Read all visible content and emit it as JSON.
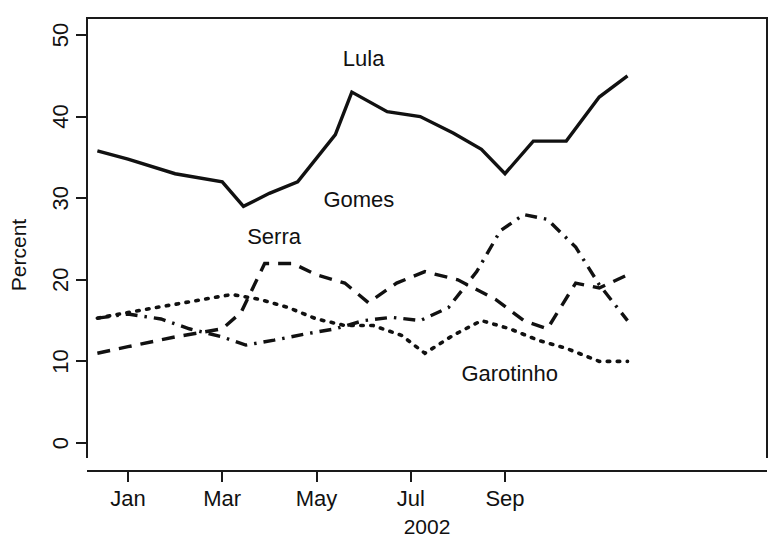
{
  "chart_data": {
    "type": "line",
    "title": "",
    "xlabel": "2002",
    "ylabel": "Percent",
    "ylim": [
      0,
      52
    ],
    "yticks": [
      0,
      10,
      20,
      30,
      40,
      50
    ],
    "ytick_labels": [
      "0",
      "10",
      "20",
      "30",
      "40",
      "50"
    ],
    "xlim": [
      0,
      12.4
    ],
    "xticks": [
      1,
      3,
      5,
      7,
      9
    ],
    "xtick_labels": [
      "Jan",
      "Mar",
      "May",
      "Jul",
      "Sep"
    ],
    "grid": false,
    "legend_position": "inline-annotations",
    "series": [
      {
        "name": "Lula",
        "style": "solid",
        "label_x": 6.0,
        "label_y": 46.2,
        "x": [
          0.35,
          1.0,
          2.0,
          3.0,
          3.45,
          4.0,
          4.6,
          5.4,
          5.75,
          6.5,
          7.2,
          7.9,
          8.5,
          9.0,
          9.6,
          10.3,
          11.0,
          11.6
        ],
        "values": [
          35.8,
          34.8,
          33.0,
          32.0,
          29.0,
          30.6,
          32.0,
          37.8,
          43.0,
          40.6,
          40.0,
          38.0,
          36.0,
          33.0,
          37.0,
          37.0,
          42.4,
          45.0
        ]
      },
      {
        "name": "Serra",
        "style": "dashed",
        "label_x": 4.1,
        "label_y": 24.4,
        "x": [
          0.35,
          1.0,
          2.0,
          2.6,
          3.0,
          3.4,
          3.9,
          4.5,
          5.0,
          5.6,
          6.1,
          6.7,
          7.3,
          8.0,
          8.8,
          9.4,
          9.9,
          10.5,
          11.0,
          11.6
        ],
        "values": [
          11.0,
          11.8,
          13.0,
          13.6,
          14.0,
          16.0,
          22.0,
          22.0,
          20.6,
          19.6,
          17.2,
          19.6,
          21.0,
          20.0,
          17.6,
          15.0,
          14.0,
          19.6,
          19.0,
          20.6
        ]
      },
      {
        "name": "Gomes",
        "style": "dashdot",
        "label_x": 5.9,
        "label_y": 28.9,
        "x": [
          0.35,
          1.0,
          1.7,
          2.3,
          3.0,
          3.5,
          4.1,
          4.8,
          5.4,
          6.0,
          6.6,
          7.2,
          7.8,
          8.4,
          8.9,
          9.4,
          9.9,
          10.5,
          11.0,
          11.6
        ],
        "values": [
          15.3,
          15.8,
          15.2,
          14.0,
          13.0,
          12.0,
          12.6,
          13.4,
          14.0,
          15.0,
          15.4,
          15.0,
          16.6,
          21.0,
          26.0,
          28.0,
          27.4,
          24.0,
          19.4,
          15.0
        ]
      },
      {
        "name": "Garotinho",
        "style": "dotted",
        "label_x": 9.1,
        "label_y": 7.6,
        "x": [
          0.35,
          1.0,
          1.8,
          2.6,
          3.2,
          3.8,
          4.4,
          5.0,
          5.6,
          6.2,
          6.8,
          7.3,
          7.9,
          8.5,
          9.1,
          9.7,
          10.3,
          11.0,
          11.6
        ],
        "values": [
          15.3,
          16.0,
          16.8,
          17.6,
          18.2,
          17.6,
          16.6,
          15.2,
          14.4,
          14.4,
          13.2,
          11.0,
          13.2,
          15.0,
          14.0,
          12.6,
          11.6,
          10.0,
          10.0
        ]
      }
    ]
  },
  "colors": {
    "ink": "#111111",
    "background": "#ffffff"
  }
}
